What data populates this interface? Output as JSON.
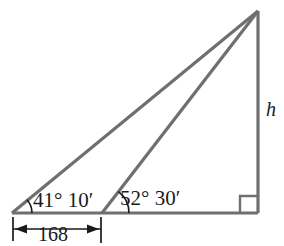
{
  "figure": {
    "colors": {
      "line": "#6f6f6f",
      "annotation": "#1a1a1a",
      "background": "#ffffff"
    },
    "labels": {
      "angle_left": "41° 10′",
      "angle_middle": "52° 30′",
      "base_length": "168",
      "height": "h"
    },
    "geometry": {
      "apex": {
        "x": 258,
        "y": 11
      },
      "left_vertex": {
        "x": 12,
        "y": 213
      },
      "middle_vertex": {
        "x": 102,
        "y": 213
      },
      "right_vertex": {
        "x": 258,
        "y": 213
      },
      "right_angle_marker": {
        "x": 240,
        "y": 195,
        "size": 18
      },
      "dimension_line_y": 229,
      "dimension_tick_top": 217,
      "dimension_tick_bottom": 243,
      "arc_left_radius": 20,
      "arc_middle_radius": 27
    },
    "icons": {
      "right_angle": "right-angle-marker",
      "arrow_left": "dimension-arrow-left",
      "arrow_right": "dimension-arrow-right"
    }
  }
}
